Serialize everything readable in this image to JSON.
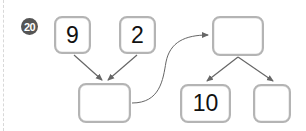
{
  "problem": {
    "number": "20"
  },
  "diagram": {
    "left_tree": {
      "top_left_value": "9",
      "top_right_value": "2",
      "result_value": ""
    },
    "right_tree": {
      "top_value": "",
      "bottom_left_value": "10",
      "bottom_right_value": ""
    }
  },
  "colors": {
    "box_border": "#b4b4b4",
    "arrow": "#666666",
    "badge_bg": "#555555",
    "badge_text": "#ffffff"
  }
}
